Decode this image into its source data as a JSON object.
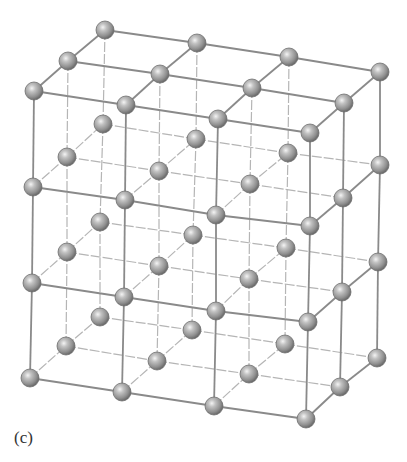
{
  "figure": {
    "label": "(c)",
    "type": "3D cubic crystal lattice (3x2x2 cells, 4x3x3 atoms... 4 wide x 4 tall x 3 deep)",
    "colors": {
      "background": "#ffffff",
      "bond_front": "#8a8a8a",
      "bond_back": "#b5b5b5",
      "atom_fill": "#9a9a9a",
      "atom_dark": "#6e6e6e",
      "atom_highlight": "#f2f2f2"
    },
    "atom_radius": 9,
    "grid": {
      "nx": 4,
      "ny": 4,
      "nz": 3,
      "comment": "positions[y][z][x] as [px,py]; y=0 top layer, z=0 front row, z=2 back row",
      "positions": [
        [
          [
            [
              34,
              91
            ],
            [
              126,
              105
            ],
            [
              218,
              119
            ],
            [
              310,
              133
            ]
          ],
          [
            [
              68,
              61
            ],
            [
              160,
              74
            ],
            [
              252,
              88
            ],
            [
              344,
              103
            ]
          ],
          [
            [
              105,
              30
            ],
            [
              197,
              43
            ],
            [
              289,
              57
            ],
            [
              380,
              72
            ]
          ]
        ],
        [
          [
            [
              33,
              187
            ],
            [
              125,
              200
            ],
            [
              216,
              215
            ],
            [
              310,
              226
            ]
          ],
          [
            [
              67,
              157
            ],
            [
              159,
              171
            ],
            [
              250,
              184
            ],
            [
              343,
              198
            ]
          ],
          [
            [
              103,
              124
            ],
            [
              196,
              139
            ],
            [
              288,
              153
            ],
            [
              380,
              165
            ]
          ]
        ],
        [
          [
            [
              32,
              283
            ],
            [
              124,
              297
            ],
            [
              216,
              311
            ],
            [
              308,
              322
            ]
          ],
          [
            [
              67,
              252
            ],
            [
              159,
              266
            ],
            [
              249,
              279
            ],
            [
              342,
              292
            ]
          ],
          [
            [
              100,
              222
            ],
            [
              193,
              235
            ],
            [
              286,
              248
            ],
            [
              378,
              262
            ]
          ]
        ],
        [
          [
            [
              30,
              378
            ],
            [
              122,
              392
            ],
            [
              214,
              406
            ],
            [
              306,
              419
            ]
          ],
          [
            [
              66,
              346
            ],
            [
              157,
              361
            ],
            [
              249,
              374
            ],
            [
              340,
              387
            ]
          ],
          [
            [
              100,
              317
            ],
            [
              192,
              330
            ],
            [
              285,
              344
            ],
            [
              377,
              358
            ]
          ]
        ]
      ]
    }
  }
}
